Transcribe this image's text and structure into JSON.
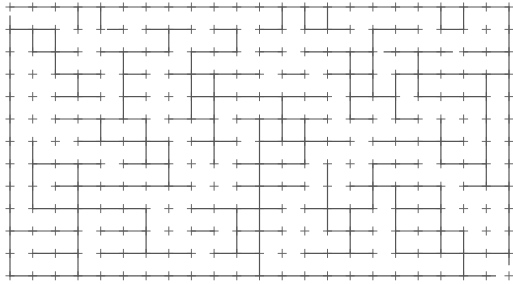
{
  "maze": {
    "cols": 22,
    "rows": 12,
    "origin": [
      10,
      7
    ],
    "cell": [
      22.68,
      22.4
    ],
    "stroke_color": "#555555",
    "tick_half_length": 4,
    "border": {
      "top": [
        [
          0,
          22
        ]
      ],
      "bottom": [
        [
          0,
          21.4
        ]
      ],
      "left": [
        [
          0.4,
          12
        ]
      ],
      "right": [
        [
          0,
          11.5
        ]
      ]
    },
    "h_walls": [
      [
        0,
        1,
        0,
        2
      ],
      [
        0,
        1,
        4.3,
        5
      ],
      [
        0,
        1,
        6,
        8
      ],
      [
        0,
        1,
        9,
        10
      ],
      [
        0,
        1,
        11,
        12
      ],
      [
        0,
        1,
        13,
        15
      ],
      [
        0,
        1,
        16,
        18
      ],
      [
        0,
        1,
        19,
        20
      ],
      [
        0,
        2,
        1,
        3
      ],
      [
        0,
        2,
        4,
        7
      ],
      [
        0,
        2,
        8,
        10
      ],
      [
        0,
        2,
        11,
        12
      ],
      [
        0,
        2,
        13,
        16
      ],
      [
        0,
        2,
        16.5,
        19.5
      ],
      [
        0,
        2,
        20,
        22
      ],
      [
        0,
        3,
        2,
        4
      ],
      [
        0,
        3,
        5,
        6
      ],
      [
        0,
        3,
        7,
        11
      ],
      [
        0,
        3,
        12,
        13
      ],
      [
        0,
        3,
        14,
        16
      ],
      [
        0,
        3,
        17,
        19
      ],
      [
        0,
        3,
        19,
        22
      ],
      [
        0,
        4,
        2,
        4
      ],
      [
        0,
        4,
        5,
        6
      ],
      [
        0,
        4,
        8,
        14
      ],
      [
        0,
        4,
        15,
        17
      ],
      [
        0,
        4,
        18,
        21
      ],
      [
        0,
        5,
        2,
        6
      ],
      [
        0,
        5,
        7,
        9
      ],
      [
        0,
        5,
        10,
        14
      ],
      [
        0,
        5,
        15,
        16
      ],
      [
        0,
        5,
        17,
        18
      ],
      [
        0,
        6,
        3,
        7
      ],
      [
        0,
        6,
        8,
        10
      ],
      [
        0,
        6,
        11,
        15
      ],
      [
        0,
        6,
        16,
        20
      ],
      [
        0,
        7,
        1,
        4
      ],
      [
        0,
        7,
        5,
        7
      ],
      [
        0,
        7,
        10,
        13
      ],
      [
        0,
        7,
        16,
        18
      ],
      [
        0,
        7,
        19,
        21
      ],
      [
        0,
        8,
        2,
        8
      ],
      [
        0,
        8,
        10,
        13
      ],
      [
        0,
        8,
        15,
        19
      ],
      [
        0,
        8,
        20,
        22
      ],
      [
        0,
        9,
        1,
        6
      ],
      [
        0,
        9,
        8,
        12
      ],
      [
        0,
        9,
        13,
        16
      ],
      [
        0,
        9,
        17,
        19
      ],
      [
        0,
        10,
        0,
        3
      ],
      [
        0,
        10,
        4,
        6
      ],
      [
        0,
        10,
        8,
        9
      ],
      [
        0,
        10,
        10,
        12
      ],
      [
        0,
        10,
        14,
        16
      ],
      [
        0,
        10,
        17,
        20
      ],
      [
        0,
        11,
        1,
        3
      ],
      [
        0,
        11,
        4,
        8
      ],
      [
        0,
        11,
        9,
        11
      ],
      [
        0,
        11,
        13,
        16
      ],
      [
        0,
        11,
        17,
        22
      ]
    ],
    "v_walls": [
      [
        1,
        3,
        0,
        1
      ],
      [
        1,
        4,
        0,
        1
      ],
      [
        1,
        12,
        0,
        1
      ],
      [
        1,
        13,
        0,
        1
      ],
      [
        1,
        14,
        0,
        1
      ],
      [
        1,
        19,
        0,
        1
      ],
      [
        1,
        20,
        0,
        1
      ],
      [
        1,
        1,
        1,
        2
      ],
      [
        1,
        2,
        1,
        3
      ],
      [
        1,
        7,
        1,
        2
      ],
      [
        1,
        10,
        1,
        2
      ],
      [
        1,
        16,
        1,
        4
      ],
      [
        1,
        5,
        2,
        5
      ],
      [
        1,
        3,
        3,
        4
      ],
      [
        1,
        8,
        2,
        5
      ],
      [
        1,
        9,
        3,
        7
      ],
      [
        1,
        12,
        4,
        6
      ],
      [
        1,
        15,
        2,
        5
      ],
      [
        1,
        17,
        3,
        5
      ],
      [
        1,
        18,
        2,
        4
      ],
      [
        1,
        21,
        3,
        8
      ],
      [
        1,
        4,
        5,
        6
      ],
      [
        1,
        6,
        5,
        7
      ],
      [
        1,
        11,
        5,
        8
      ],
      [
        1,
        13,
        5,
        7
      ],
      [
        1,
        19,
        5,
        7
      ],
      [
        1,
        1,
        6,
        9
      ],
      [
        1,
        3,
        7,
        8
      ],
      [
        1,
        7,
        6,
        8
      ],
      [
        1,
        14,
        7,
        10
      ],
      [
        1,
        16,
        7,
        9
      ],
      [
        1,
        17,
        8,
        11
      ],
      [
        1,
        3,
        8,
        12
      ],
      [
        1,
        6,
        9,
        11
      ],
      [
        1,
        10,
        9,
        11
      ],
      [
        1,
        11,
        8,
        12
      ],
      [
        1,
        15,
        9,
        11
      ],
      [
        1,
        19,
        8,
        11
      ],
      [
        1,
        20,
        10,
        12
      ]
    ],
    "entrance": "top-left",
    "exit": "bottom-right"
  }
}
